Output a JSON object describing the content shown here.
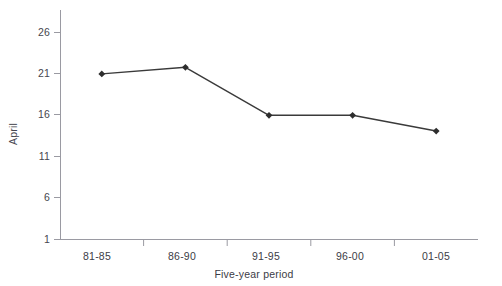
{
  "chart_data": {
    "type": "line",
    "title": "",
    "xlabel": "Five-year period",
    "ylabel": "April",
    "categories": [
      "81-85",
      "86-90",
      "91-95",
      "96-00",
      "01-05"
    ],
    "values": [
      21.0,
      21.8,
      16.0,
      16.0,
      14.1
    ],
    "series": [
      {
        "name": "April",
        "values": [
          21.0,
          21.8,
          16.0,
          16.0,
          14.1
        ]
      }
    ],
    "ylim": [
      1,
      27.5
    ],
    "yticks": [
      1,
      6,
      11,
      16,
      21,
      26
    ],
    "ytick_labels": [
      "1",
      "6",
      "11",
      "16",
      "21",
      "26"
    ],
    "grid": false,
    "legend": false,
    "legend_position": "none",
    "marker": "diamond",
    "line_color": "#3a3a3a",
    "axis_color": "#9a9aa2",
    "text_color": "#3c3c46"
  }
}
